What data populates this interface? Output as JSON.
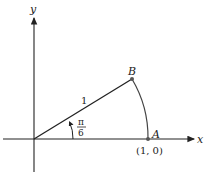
{
  "diagram": {
    "type": "unit-circle-angle",
    "axes": {
      "x_label": "x",
      "y_label": "y"
    },
    "points": {
      "origin": {
        "px": [
          34,
          139
        ]
      },
      "A": {
        "label": "A",
        "coord_label": "(1, 0)",
        "px": [
          148,
          139
        ]
      },
      "B": {
        "label": "B",
        "px": [
          132,
          79
        ]
      }
    },
    "segment_label": "1",
    "angle": {
      "numerator": "π",
      "denominator": "6"
    },
    "colors": {
      "stroke": "#222222",
      "point": "#555555"
    }
  }
}
